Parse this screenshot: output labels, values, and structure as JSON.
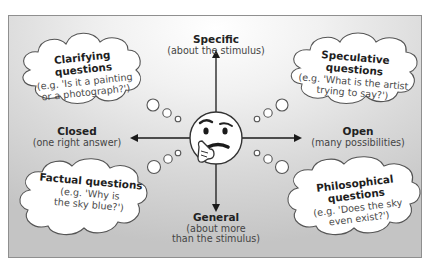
{
  "caption": "",
  "axes": {
    "top": {
      "title": "Specific",
      "subtitle": "(about the stimulus)"
    },
    "bottom": {
      "title": "General",
      "subtitle_line1": "(about more",
      "subtitle_line2": "than the stimulus)"
    },
    "left": {
      "title": "Closed",
      "subtitle": "(one right answer)"
    },
    "right": {
      "title": "Open",
      "subtitle": "(many possibilities)"
    }
  },
  "clouds": [
    {
      "id": "clarifying",
      "title": "Clarifying questions",
      "line1": "(e.g. 'Is it a painting",
      "line2": "or a photograph?')"
    },
    {
      "id": "speculative",
      "title": "Speculative questions",
      "line1": "(e.g. 'What is the artist",
      "line2": "trying to say?')"
    },
    {
      "id": "factual",
      "title": "Factual questions",
      "line1": "(e.g. 'Why is",
      "line2": "the sky blue?')"
    },
    {
      "id": "philosophical",
      "title": "Philosophical questions",
      "line1": "(e.g. 'Does the sky",
      "line2": "even exist?')"
    }
  ],
  "center": {
    "icon": "thinking-face-emoji"
  },
  "colors": {
    "panel_border": "#8f8f8f",
    "line": "#1a1a1a",
    "cloud_fill": "#ffffff",
    "cloud_stroke": "#555555"
  }
}
